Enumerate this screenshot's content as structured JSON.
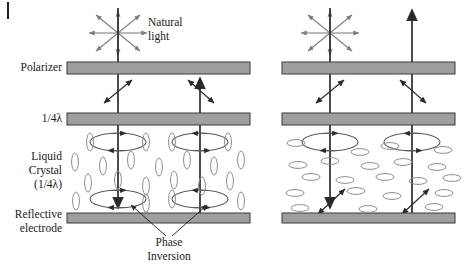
{
  "figure": {
    "corner_mark": "|"
  },
  "labels": {
    "polarizer": "Polarizer",
    "quarter_wave": "1/4λ",
    "liquid_crystal_line1": "Liquid",
    "liquid_crystal_line2": "Crystal",
    "liquid_crystal_line3": "(1/4λ)",
    "reflective_line1": "Reflective",
    "reflective_line2": "electrode",
    "natural_light_line1": "Natural",
    "natural_light_line2": "light",
    "phase_inversion_line1": "Phase",
    "phase_inversion_line2": "Inversion"
  },
  "colors": {
    "bar_fill": "#9e9e9e",
    "bar_stroke": "#3a3a3a",
    "ray_stroke": "#2b2b2b",
    "light_arrow_stroke": "#7d7d7d",
    "crystal_stroke": "#8d8d8d",
    "text": "#1a1a1a",
    "background": "#ffffff"
  },
  "panels": [
    {
      "name": "dark-state-panel",
      "state": "dark",
      "crystal_orientation": "vertical",
      "bar_x": 67,
      "bar_width": 183,
      "incident_ray_x": 118,
      "return_ray_x": 200,
      "light_exits": false,
      "description": "Incident natural light is polarized, circularly polarized by the quarter-wave plate and liquid crystal, reflected with phase inversion, and absorbed at the polarizer so no light exits."
    },
    {
      "name": "bright-state-panel",
      "state": "bright",
      "crystal_orientation": "horizontal",
      "bar_x": 282,
      "bar_width": 173,
      "incident_ray_x": 330,
      "return_ray_x": 412,
      "light_exits": true,
      "description": "With the liquid crystal molecules lying flat, the returning beam matches the polarizer axis and light exits upward."
    }
  ],
  "bars": [
    {
      "name": "polarizer-bar",
      "y": 62,
      "height": 12
    },
    {
      "name": "quarter-wave-bar",
      "y": 113,
      "height": 12
    },
    {
      "name": "reflective-electrode-bar",
      "y": 213,
      "height": 10
    }
  ],
  "natural_light_rays": 8
}
